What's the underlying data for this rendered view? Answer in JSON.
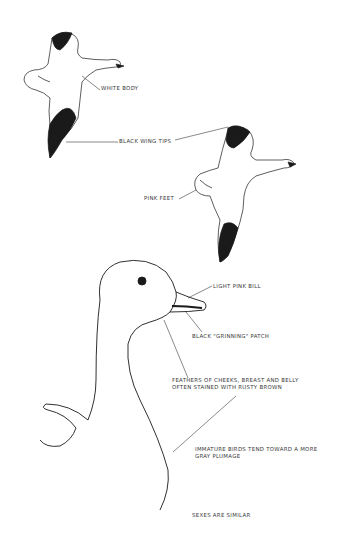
{
  "labels": {
    "white_body": "WHITE BODY",
    "black_wing_tips": "BLACK WING TIPS",
    "pink_feet": "PINK FEET",
    "light_pink_bill": "LIGHT PINK BILL",
    "grinning_patch": "BLACK \"GRINNING\" PATCH",
    "feathers_line1": "FEATHERS OF CHEEKS, BREAST AND BELLY",
    "feathers_line2": "OFTEN STAINED WITH RUSTY BROWN",
    "immature_line1": "IMMATURE BIRDS TEND TOWARD A MORE",
    "immature_line2": "GRAY PLUMAGE",
    "sexes": "SEXES ARE SIMILAR"
  },
  "colors": {
    "ink": "#1a1a1a",
    "text": "#3a3a3a",
    "background": "#ffffff"
  }
}
